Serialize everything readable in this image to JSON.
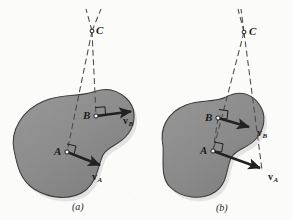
{
  "figure": {
    "background_color": "#fbfbfa",
    "body_fill_color": "#8d8d8d",
    "body_edge_color": "#3b3b3b",
    "vector_color": "#242424",
    "construction_line_color": "#4a4a4a",
    "label_color": "#1b1b1b"
  },
  "panels": [
    {
      "id": "a",
      "caption": "(a)",
      "caption_x": 72,
      "caption_y": 201,
      "center_label": {
        "text": "C",
        "x": 96,
        "y": 25,
        "point_x": 92,
        "point_y": 31
      },
      "points": [
        {
          "name": "A",
          "label": "A",
          "label_x": 54,
          "label_y": 146,
          "x": 67,
          "y": 152,
          "right_angle": true
        },
        {
          "name": "B",
          "label": "B",
          "label_x": 83,
          "label_y": 110,
          "x": 96,
          "y": 116,
          "right_angle": true
        }
      ],
      "vectors": [
        {
          "name": "v_A",
          "symbol": "v",
          "subscript": "A",
          "label_x": 92,
          "label_y": 172,
          "from_x": 67,
          "from_y": 152,
          "to_x": 103,
          "to_y": 166
        },
        {
          "name": "v_B",
          "symbol": "v",
          "subscript": "B",
          "label_x": 123,
          "label_y": 116,
          "from_x": 96,
          "from_y": 116,
          "to_x": 134,
          "to_y": 111
        }
      ]
    },
    {
      "id": "b",
      "caption": "(b)",
      "caption_x": 216,
      "caption_y": 202,
      "center_label": {
        "text": "C",
        "x": 249,
        "y": 26,
        "point_x": 244,
        "point_y": 32
      },
      "points": [
        {
          "name": "A",
          "label": "A",
          "label_x": 200,
          "label_y": 145,
          "x": 213,
          "y": 151,
          "right_angle": true
        },
        {
          "name": "B",
          "label": "B",
          "label_x": 205,
          "label_y": 112,
          "x": 218,
          "y": 118,
          "right_angle": true
        }
      ],
      "vectors": [
        {
          "name": "v_A",
          "symbol": "v",
          "subscript": "A",
          "label_x": 268,
          "label_y": 172,
          "from_x": 213,
          "from_y": 151,
          "to_x": 263,
          "to_y": 169
        },
        {
          "name": "v_B",
          "symbol": "v",
          "subscript": "B",
          "label_x": 257,
          "label_y": 128,
          "from_x": 218,
          "from_y": 118,
          "to_x": 252,
          "to_y": 128
        }
      ]
    }
  ]
}
